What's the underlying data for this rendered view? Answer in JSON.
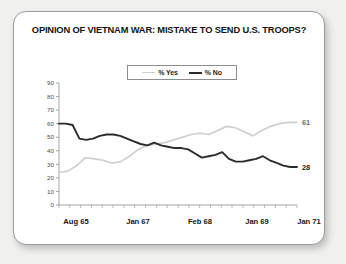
{
  "card": {
    "title": "OPINION OF VIETNAM WAR: MISTAKE TO SEND U.S. TROOPS?"
  },
  "legend": {
    "items": [
      {
        "label": "% Yes",
        "color": "#cfcfcf",
        "key": "yes"
      },
      {
        "label": "% No",
        "color": "#2b2b2b",
        "key": "no"
      }
    ]
  },
  "end_labels": {
    "yes": "61",
    "no": "28"
  },
  "chart_data": {
    "type": "line",
    "title": "OPINION OF VIETNAM WAR: MISTAKE TO SEND U.S. TROOPS?",
    "xlabel": "",
    "ylabel": "",
    "ylim": [
      0,
      90
    ],
    "ytick_step": 10,
    "yticks": [
      0,
      10,
      20,
      30,
      40,
      50,
      60,
      70,
      80,
      90
    ],
    "grid": false,
    "legend_position": "top-center",
    "xtick_labels": [
      "Aug 65",
      "Jan 67",
      "Feb 68",
      "Jan 69",
      "Jan 71"
    ],
    "xtick_label_positions": [
      0,
      6,
      11,
      15,
      20
    ],
    "n_points": 24,
    "series": [
      {
        "name": "% Yes",
        "color": "#cfcfcf",
        "end_value": 61,
        "values": [
          24,
          25,
          29,
          35,
          34,
          33,
          31,
          32,
          36,
          41,
          44,
          45,
          46,
          48,
          50,
          52,
          53,
          52,
          55,
          58,
          57,
          54,
          51,
          55,
          58,
          60,
          61,
          61
        ]
      },
      {
        "name": "% No",
        "color": "#2b2b2b",
        "end_value": 28,
        "values": [
          60,
          60,
          59,
          49,
          48,
          49,
          51,
          52,
          52,
          51,
          49,
          47,
          45,
          44,
          46,
          44,
          43,
          42,
          42,
          41,
          38,
          35,
          36,
          37,
          39,
          34,
          32,
          32,
          33,
          34,
          36,
          33,
          31,
          29,
          28,
          28
        ]
      }
    ]
  }
}
